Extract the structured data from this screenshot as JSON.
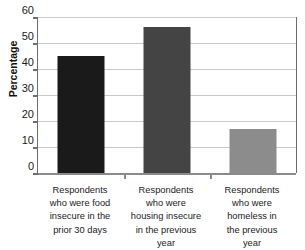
{
  "chart_data": {
    "type": "bar",
    "title": "",
    "xlabel": "",
    "ylabel": "Percentage",
    "ylim": [
      0,
      60
    ],
    "yticks": [
      60,
      50,
      40,
      30,
      20,
      10,
      0
    ],
    "ytick_labels": [
      "60",
      "50",
      "40",
      "30",
      "20",
      "10",
      "0"
    ],
    "grid": true,
    "legend": "none",
    "categories": [
      "Respondents who were food insecure in the prior 30 days",
      "Respondents who were housing insecure in the previous year",
      "Respondents who were homeless in the previous year"
    ],
    "category_lines": [
      [
        "Respondents",
        "who were food",
        "insecure in the",
        "prior 30 days"
      ],
      [
        "Respondents",
        "who were",
        "housing insecure",
        "in the previous",
        "year"
      ],
      [
        "Respondents",
        "who were",
        "homeless in",
        "the previous",
        "year"
      ]
    ],
    "values": [
      45,
      56,
      17
    ],
    "bar_colors": [
      "#1a1a1a",
      "#444444",
      "#8c8c8c"
    ]
  },
  "colors": {
    "axis": "#6d6d6d",
    "gridline": "#c9c9c9",
    "baseline": "#8a8a8a",
    "text": "#1b1b1b",
    "bar_1": "#1a1a1a",
    "bar_2": "#444444",
    "bar_3": "#8c8c8c"
  }
}
